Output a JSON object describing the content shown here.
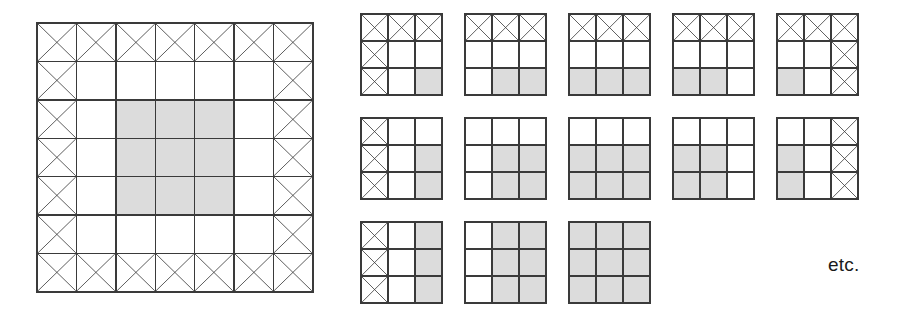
{
  "figure": {
    "etc_label": "etc.",
    "colors": {
      "line": "#3a3a3a",
      "shaded_fill": "#dcdcdc",
      "empty_fill": "#ffffff",
      "text": "#1a1a1a",
      "background": "#ffffff"
    }
  },
  "chart_data": {
    "type": "table",
    "title": "",
    "xlabel": "",
    "ylabel": "",
    "legend": [
      {
        "key": "x",
        "label": "crossed-out cell",
        "fill": "#ffffff"
      },
      {
        "key": "shaded",
        "label": "shaded cell",
        "fill": "#dcdcdc"
      },
      {
        "key": "empty",
        "label": "empty cell",
        "fill": "#ffffff"
      }
    ],
    "big_grid": {
      "name": "big-grid",
      "rows": 7,
      "cols": 7,
      "x_count": 24,
      "shaded_count": 9,
      "cells": [
        [
          "x",
          "x",
          "x",
          "x",
          "x",
          "x",
          "x"
        ],
        [
          "x",
          "",
          "",
          "",
          "",
          "",
          "x"
        ],
        [
          "x",
          "",
          "shaded",
          "shaded",
          "shaded",
          "",
          "x"
        ],
        [
          "x",
          "",
          "shaded",
          "shaded",
          "shaded",
          "",
          "x"
        ],
        [
          "x",
          "",
          "shaded",
          "shaded",
          "shaded",
          "",
          "x"
        ],
        [
          "x",
          "",
          "",
          "",
          "",
          "",
          "x"
        ],
        [
          "x",
          "x",
          "x",
          "x",
          "x",
          "x",
          "x"
        ]
      ]
    },
    "small_grids": [
      {
        "name": "small-grid-1",
        "rows": 3,
        "cols": 3,
        "x_count": 5,
        "shaded_count": 1,
        "cells": [
          [
            "x",
            "x",
            "x"
          ],
          [
            "x",
            "",
            ""
          ],
          [
            "x",
            "",
            "shaded"
          ]
        ]
      },
      {
        "name": "small-grid-2",
        "rows": 3,
        "cols": 3,
        "x_count": 3,
        "shaded_count": 2,
        "cells": [
          [
            "x",
            "x",
            "x"
          ],
          [
            "",
            "",
            ""
          ],
          [
            "",
            "shaded",
            "shaded"
          ]
        ]
      },
      {
        "name": "small-grid-3",
        "rows": 3,
        "cols": 3,
        "x_count": 3,
        "shaded_count": 3,
        "cells": [
          [
            "x",
            "x",
            "x"
          ],
          [
            "",
            "",
            ""
          ],
          [
            "shaded",
            "shaded",
            "shaded"
          ]
        ]
      },
      {
        "name": "small-grid-4",
        "rows": 3,
        "cols": 3,
        "x_count": 3,
        "shaded_count": 2,
        "cells": [
          [
            "x",
            "x",
            "x"
          ],
          [
            "",
            "",
            ""
          ],
          [
            "shaded",
            "shaded",
            ""
          ]
        ]
      },
      {
        "name": "small-grid-5",
        "rows": 3,
        "cols": 3,
        "x_count": 5,
        "shaded_count": 1,
        "cells": [
          [
            "x",
            "x",
            "x"
          ],
          [
            "",
            "",
            "x"
          ],
          [
            "shaded",
            "",
            "x"
          ]
        ]
      },
      {
        "name": "small-grid-6",
        "rows": 3,
        "cols": 3,
        "x_count": 3,
        "shaded_count": 2,
        "cells": [
          [
            "x",
            "",
            ""
          ],
          [
            "x",
            "",
            "shaded"
          ],
          [
            "x",
            "",
            "shaded"
          ]
        ]
      },
      {
        "name": "small-grid-7",
        "rows": 3,
        "cols": 3,
        "x_count": 0,
        "shaded_count": 4,
        "cells": [
          [
            "",
            "",
            ""
          ],
          [
            "",
            "shaded",
            "shaded"
          ],
          [
            "",
            "shaded",
            "shaded"
          ]
        ]
      },
      {
        "name": "small-grid-8",
        "rows": 3,
        "cols": 3,
        "x_count": 0,
        "shaded_count": 6,
        "cells": [
          [
            "",
            "",
            ""
          ],
          [
            "shaded",
            "shaded",
            "shaded"
          ],
          [
            "shaded",
            "shaded",
            "shaded"
          ]
        ]
      },
      {
        "name": "small-grid-9",
        "rows": 3,
        "cols": 3,
        "x_count": 0,
        "shaded_count": 4,
        "cells": [
          [
            "",
            "",
            ""
          ],
          [
            "shaded",
            "shaded",
            ""
          ],
          [
            "shaded",
            "shaded",
            ""
          ]
        ]
      },
      {
        "name": "small-grid-10",
        "rows": 3,
        "cols": 3,
        "x_count": 3,
        "shaded_count": 2,
        "cells": [
          [
            "",
            "",
            "x"
          ],
          [
            "shaded",
            "",
            "x"
          ],
          [
            "shaded",
            "",
            "x"
          ]
        ]
      },
      {
        "name": "small-grid-11",
        "rows": 3,
        "cols": 3,
        "x_count": 3,
        "shaded_count": 3,
        "cells": [
          [
            "x",
            "",
            "shaded"
          ],
          [
            "x",
            "",
            "shaded"
          ],
          [
            "x",
            "",
            "shaded"
          ]
        ]
      },
      {
        "name": "small-grid-12",
        "rows": 3,
        "cols": 3,
        "x_count": 0,
        "shaded_count": 6,
        "cells": [
          [
            "",
            "shaded",
            "shaded"
          ],
          [
            "",
            "shaded",
            "shaded"
          ],
          [
            "",
            "shaded",
            "shaded"
          ]
        ]
      },
      {
        "name": "small-grid-13",
        "rows": 3,
        "cols": 3,
        "x_count": 0,
        "shaded_count": 9,
        "cells": [
          [
            "shaded",
            "shaded",
            "shaded"
          ],
          [
            "shaded",
            "shaded",
            "shaded"
          ],
          [
            "shaded",
            "shaded",
            "shaded"
          ]
        ]
      }
    ],
    "small_grid_layout": {
      "rows": [
        {
          "count": 5,
          "top": 13,
          "lefts": [
            360,
            464,
            568,
            672,
            776
          ]
        },
        {
          "count": 5,
          "top": 117,
          "lefts": [
            360,
            464,
            568,
            672,
            776
          ]
        },
        {
          "count": 3,
          "top": 221,
          "lefts": [
            360,
            464,
            568
          ]
        }
      ]
    }
  }
}
